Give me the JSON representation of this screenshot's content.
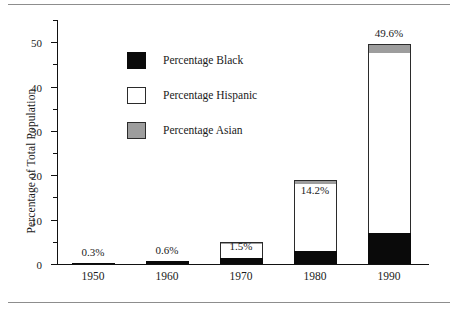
{
  "chart_data": {
    "type": "bar",
    "subtype": "stacked",
    "title": "",
    "xlabel": "",
    "ylabel": "Percentage of Total Population",
    "categories": [
      "1950",
      "1960",
      "1970",
      "1980",
      "1990"
    ],
    "ylim": [
      0,
      55
    ],
    "yticks": [
      0,
      10,
      20,
      30,
      40,
      50
    ],
    "yticklabels": [
      "0",
      "10",
      "20",
      "30",
      "40",
      "50"
    ],
    "yminorticks": [
      5,
      15,
      25,
      35,
      45,
      55
    ],
    "grid": false,
    "legend_position": "upper-center-left",
    "series": [
      {
        "name": "Percentage Black",
        "color": "#0a0a0a",
        "values": [
          0.3,
          0.6,
          1.3,
          3.0,
          7.0
        ]
      },
      {
        "name": "Percentage Hispanic",
        "color": "#ffffff",
        "values": [
          0.0,
          0.0,
          3.3,
          15.0,
          40.5
        ]
      },
      {
        "name": "Percentage Asian",
        "color": "#9d9d9d",
        "values": [
          0.0,
          0.0,
          0.4,
          1.0,
          2.0
        ]
      }
    ],
    "totals": [
      0.3,
      0.6,
      1.5,
      14.2,
      49.6
    ],
    "annotations": [
      "0.3%",
      "0.6%",
      "1.5%",
      "14.2%",
      "49.6%"
    ]
  },
  "legend": {
    "items": [
      {
        "label": "Percentage Black",
        "swatch": "black-swatch"
      },
      {
        "label": "Percentage Hispanic",
        "swatch": "white-swatch"
      },
      {
        "label": "Percentage Asian",
        "swatch": "gray-swatch"
      }
    ]
  },
  "colors": {
    "black": "#0a0a0a",
    "hispanic": "#ffffff",
    "asian": "#9d9d9d",
    "axis": "#111111",
    "rule": "#8d8d8d"
  }
}
